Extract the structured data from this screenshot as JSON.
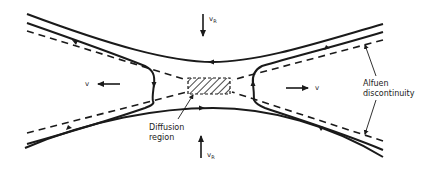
{
  "diagram": {
    "labels": {
      "inflow_top": "v",
      "inflow_top_sub": "R",
      "inflow_bottom": "v",
      "inflow_bottom_sub": "R",
      "outflow_left": "v",
      "outflow_right": "v",
      "diffusion_line1": "Diffusion",
      "diffusion_line2": "region",
      "alfven_line1": "Alfuen",
      "alfven_line2": "discontinuity"
    },
    "colors": {
      "ink": "#1a1a1a",
      "background": "#ffffff"
    }
  }
}
